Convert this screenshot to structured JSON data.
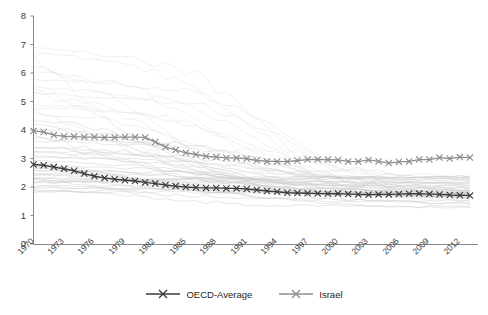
{
  "chart_data": {
    "type": "line",
    "title": "",
    "xlabel": "",
    "ylabel": "",
    "ylim": [
      0,
      8
    ],
    "xlim": [
      1970,
      2013
    ],
    "grid": false,
    "legend_position": "bottom-center",
    "y_ticks": [
      "0",
      "1",
      "2",
      "3",
      "4",
      "5",
      "6",
      "7",
      "8"
    ],
    "x_ticks": [
      "1970",
      "1973",
      "1976",
      "1979",
      "1982",
      "1985",
      "1988",
      "1991",
      "1994",
      "1997",
      "2000",
      "2003",
      "2006",
      "2009",
      "2012"
    ],
    "x": [
      1970,
      1971,
      1972,
      1973,
      1974,
      1975,
      1976,
      1977,
      1978,
      1979,
      1980,
      1981,
      1982,
      1983,
      1984,
      1985,
      1986,
      1987,
      1988,
      1989,
      1990,
      1991,
      1992,
      1993,
      1994,
      1995,
      1996,
      1997,
      1998,
      1999,
      2000,
      2001,
      2002,
      2003,
      2004,
      2005,
      2006,
      2007,
      2008,
      2009,
      2010,
      2011,
      2012,
      2013
    ],
    "series": [
      {
        "name": "OECD-Average",
        "color": "#3b3b3b",
        "marker": "x",
        "values": [
          2.79,
          2.76,
          2.7,
          2.64,
          2.57,
          2.47,
          2.38,
          2.32,
          2.27,
          2.24,
          2.21,
          2.16,
          2.12,
          2.07,
          2.03,
          2.0,
          1.98,
          1.97,
          1.97,
          1.95,
          1.95,
          1.93,
          1.9,
          1.86,
          1.83,
          1.8,
          1.79,
          1.78,
          1.77,
          1.76,
          1.77,
          1.75,
          1.74,
          1.73,
          1.74,
          1.74,
          1.75,
          1.76,
          1.77,
          1.75,
          1.74,
          1.72,
          1.71,
          1.7
        ]
      },
      {
        "name": "Israel",
        "color": "#8e8e8e",
        "marker": "x",
        "values": [
          3.97,
          3.93,
          3.82,
          3.78,
          3.77,
          3.75,
          3.75,
          3.74,
          3.74,
          3.75,
          3.75,
          3.74,
          3.58,
          3.4,
          3.3,
          3.2,
          3.14,
          3.08,
          3.05,
          3.02,
          3.02,
          2.99,
          2.93,
          2.9,
          2.9,
          2.89,
          2.93,
          2.96,
          2.97,
          2.96,
          2.95,
          2.9,
          2.89,
          2.95,
          2.9,
          2.84,
          2.88,
          2.9,
          2.96,
          2.96,
          3.03,
          3.0,
          3.05,
          3.03
        ]
      }
    ],
    "background_series_note": "faint gray individual OECD country fertility lines"
  },
  "legend": {
    "items": [
      {
        "label": "OECD-Average"
      },
      {
        "label": "Israel"
      }
    ]
  }
}
